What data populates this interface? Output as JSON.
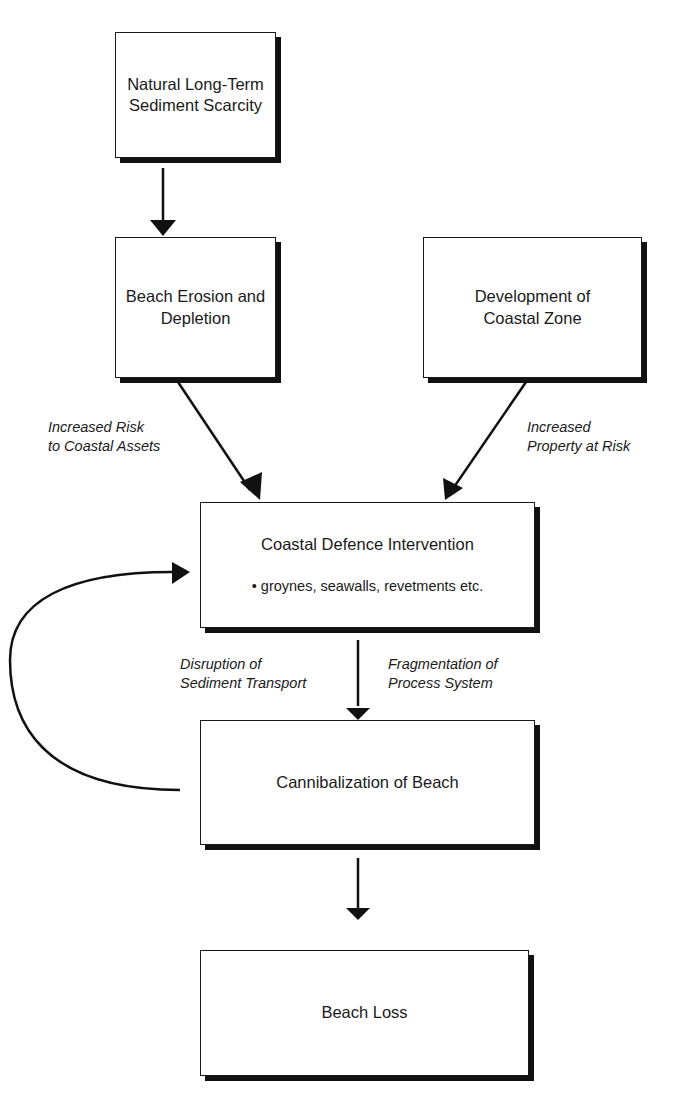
{
  "diagram": {
    "nodes": {
      "scarcity": {
        "line1": "Natural Long-Term",
        "line2": "Sediment Scarcity"
      },
      "erosion": {
        "line1": "Beach Erosion and",
        "line2": "Depletion"
      },
      "development": {
        "line1": "Development of",
        "line2": "Coastal Zone"
      },
      "defence": {
        "title": "Coastal Defence Intervention",
        "bullet": "• groynes, seawalls, revetments etc."
      },
      "cannibalization": {
        "title": "Cannibalization of Beach"
      },
      "loss": {
        "title": "Beach Loss"
      }
    },
    "edge_labels": {
      "risk": {
        "line1": "Increased Risk",
        "line2": "to Coastal Assets"
      },
      "property": {
        "line1": "Increased",
        "line2": "Property at Risk"
      },
      "disruption": {
        "line1": "Disruption of",
        "line2": "Sediment Transport"
      },
      "fragmentation": {
        "line1": "Fragmentation of",
        "line2": "Process System"
      }
    },
    "edges": [
      {
        "from": "scarcity",
        "to": "erosion"
      },
      {
        "from": "erosion",
        "to": "defence",
        "label": "risk"
      },
      {
        "from": "development",
        "to": "defence",
        "label": "property"
      },
      {
        "from": "defence",
        "to": "cannibalization",
        "label": "disruption/fragmentation"
      },
      {
        "from": "cannibalization",
        "to": "defence",
        "type": "feedback-loop"
      },
      {
        "from": "cannibalization",
        "to": "loss"
      }
    ]
  }
}
